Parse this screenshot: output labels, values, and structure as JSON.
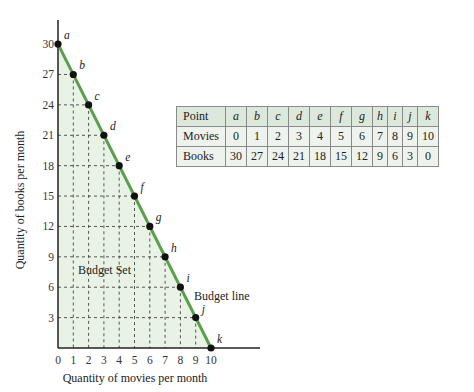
{
  "chart_data": {
    "type": "line",
    "title": "",
    "xlabel": "Quantity of movies per month",
    "ylabel": "Quantity of books per month",
    "xlim": [
      0,
      10
    ],
    "ylim": [
      0,
      30
    ],
    "x_ticks": [
      0,
      1,
      2,
      3,
      4,
      5,
      6,
      7,
      8,
      9,
      10
    ],
    "y_ticks": [
      3,
      6,
      9,
      12,
      15,
      18,
      21,
      24,
      27,
      30
    ],
    "grid": "dashed guides from each point to axes",
    "series": [
      {
        "name": "Budget line",
        "color": "#5a9e4e",
        "points": [
          {
            "label": "a",
            "x": 0,
            "y": 30
          },
          {
            "label": "b",
            "x": 1,
            "y": 27
          },
          {
            "label": "c",
            "x": 2,
            "y": 24
          },
          {
            "label": "d",
            "x": 3,
            "y": 21
          },
          {
            "label": "e",
            "x": 4,
            "y": 18
          },
          {
            "label": "f",
            "x": 5,
            "y": 15
          },
          {
            "label": "g",
            "x": 6,
            "y": 12
          },
          {
            "label": "h",
            "x": 7,
            "y": 9
          },
          {
            "label": "i",
            "x": 8,
            "y": 6
          },
          {
            "label": "j",
            "x": 9,
            "y": 3
          },
          {
            "label": "k",
            "x": 10,
            "y": 0
          }
        ]
      }
    ],
    "annotations": [
      "Budget Set",
      "Budget line"
    ],
    "fill_color": "#e8f3e6"
  },
  "table": {
    "header": [
      "Point",
      "a",
      "b",
      "c",
      "d",
      "e",
      "f",
      "g",
      "h",
      "i",
      "j",
      "k"
    ],
    "rows": [
      [
        "Movies",
        "0",
        "1",
        "2",
        "3",
        "4",
        "5",
        "6",
        "7",
        "8",
        "9",
        "10"
      ],
      [
        "Books",
        "30",
        "27",
        "24",
        "21",
        "18",
        "15",
        "12",
        "9",
        "6",
        "3",
        "0"
      ]
    ]
  }
}
